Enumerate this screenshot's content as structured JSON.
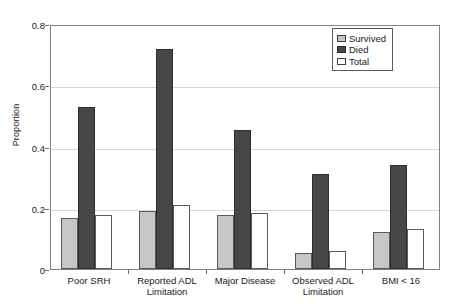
{
  "chart_data": {
    "type": "bar",
    "title": "",
    "xlabel": "",
    "ylabel": "Proportion",
    "ylim": [
      0,
      0.8
    ],
    "yticks": [
      "0",
      "0.2",
      "0.4",
      "0.6",
      "0.8"
    ],
    "ytick_values": [
      0,
      0.2,
      0.4,
      0.6,
      0.8
    ],
    "grid": "horizontal",
    "legend_position": "top-right",
    "categories": [
      "Poor SRH",
      "Reported ADL Limitation",
      "Major Disease",
      "Observed ADL Limitation",
      "BMI < 16"
    ],
    "category_lines": [
      [
        "Poor SRH"
      ],
      [
        "Reported ADL",
        "Limitation"
      ],
      [
        "Major Disease"
      ],
      [
        "Observed ADL",
        "Limitation"
      ],
      [
        "BMI < 16"
      ]
    ],
    "series": [
      {
        "name": "Survived",
        "color": "#c6c6c6",
        "values": [
          0.166,
          0.19,
          0.175,
          0.053,
          0.12
        ]
      },
      {
        "name": "Died",
        "color": "#474747",
        "values": [
          0.53,
          0.72,
          0.455,
          0.31,
          0.34
        ]
      },
      {
        "name": "Total",
        "color": "#ffffff",
        "values": [
          0.176,
          0.21,
          0.183,
          0.06,
          0.13
        ]
      }
    ]
  },
  "legend": {
    "items": [
      {
        "label": "Survived",
        "swatch": "survived"
      },
      {
        "label": "Died",
        "swatch": "died"
      },
      {
        "label": "Total",
        "swatch": "total"
      }
    ]
  },
  "axis": {
    "y_title": "Proportion"
  }
}
